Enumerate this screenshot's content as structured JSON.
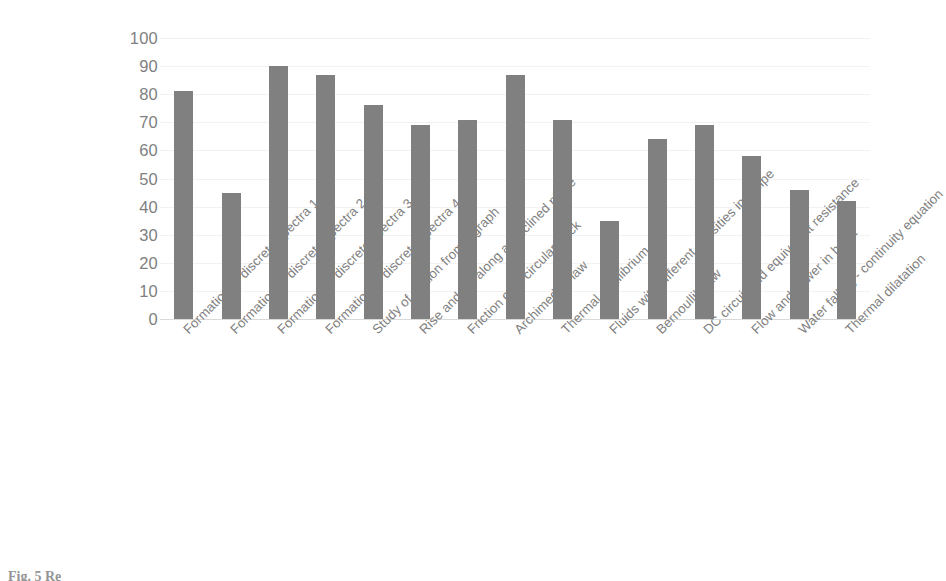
{
  "figure": {
    "caption": "Fig. 5  Re",
    "background_color": "#ffffff"
  },
  "chart_data": {
    "type": "bar",
    "title": "",
    "subtitle": "",
    "xlabel": "",
    "ylabel": "",
    "ylim": [
      0,
      100
    ],
    "ytick_step": 10,
    "grid": true,
    "legend": false,
    "bar_color": "#808080",
    "axis_text_color": "#808080",
    "yticks": [
      100,
      90,
      80,
      70,
      60,
      50,
      40,
      30,
      20,
      10,
      0
    ],
    "categories": [
      "Formation of discrete spectra 1",
      "Formation of discrete spectra 2",
      "Formation of discrete spectra 3",
      "Formation of discrete spectra 4",
      "Study of motion from a graph",
      "Rise and fall along an inclined plane",
      "Friction on a circular track",
      "Archimede's law",
      "Thermal equilibrium",
      "Fluids with different densities in a pipe",
      "Bernoulli's law",
      "DC circuit and equivalent resistance",
      "Flow and power in heart",
      "Water falling - continuity equation",
      "Thermal dilatation"
    ],
    "values": [
      81,
      45,
      90,
      87,
      76,
      69,
      71,
      87,
      71,
      35,
      64,
      69,
      58,
      46,
      42
    ]
  }
}
